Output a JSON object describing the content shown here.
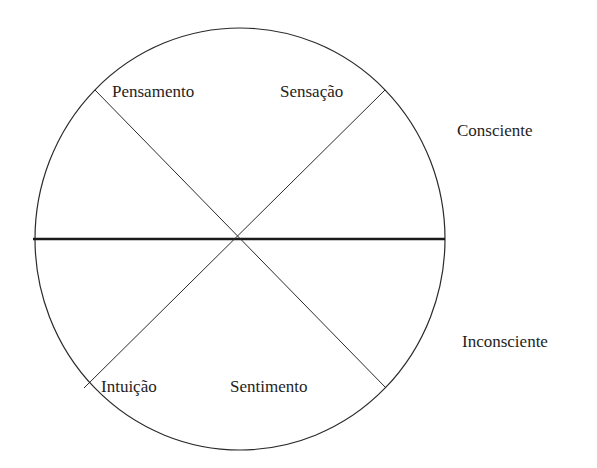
{
  "diagram": {
    "type": "psychological-types-circle",
    "quadrant_labels": {
      "top_left": "Pensamento",
      "top_right": "Sensação",
      "bottom_left": "Intuição",
      "bottom_right": "Sentimento"
    },
    "side_labels": {
      "upper": "Consciente",
      "lower": "Inconsciente"
    },
    "colors": {
      "stroke": "#2a2a2a",
      "text": "#1e1e1e",
      "background": "#ffffff"
    }
  }
}
